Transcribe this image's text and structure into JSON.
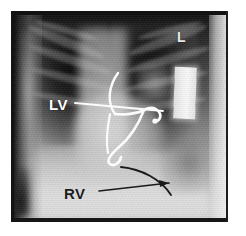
{
  "figure": {
    "kind": "chest-radiograph",
    "modality": "X-ray",
    "view": "frontal chest",
    "background_color": "#ffffff",
    "film_border_color": "#141414"
  },
  "annotations": {
    "lv": {
      "label": "LV",
      "color": "#ffffff",
      "pointer": "white line from label to left ventricular lead tip",
      "description": "left ventricular pacing lead"
    },
    "rv": {
      "label": "RV",
      "color": "#1c1c1c",
      "pointer": "black arrow from label to curved black contour",
      "description": "right ventricular lead / border"
    },
    "side_marker": {
      "label": "L",
      "color": "#e8e8e8",
      "description": "left side radiographic marker"
    }
  },
  "overlay_graphics": {
    "lv_pointer_line": "M 64 92 L 152 100",
    "lead_upper_curve": "M 107 62 C 97 76, 96 92, 104 103",
    "lead_main": "M 104 103 C 112 104, 126 103, 133 99 C 140 95, 145 97, 148 101 C 151 105, 149 110, 143 111",
    "lead_descending": "M 133 99 C 128 112, 120 126, 108 136 C 99 144, 95 150, 99 153 C 103 156, 109 152, 110 146",
    "lead_left_tail": "M 99 103 C 96 118, 95 132, 97 142",
    "lead_tip_dot": {
      "cx": 144,
      "cy": 110,
      "r": 2.6
    },
    "rv_curve": "M 110 156 C 130 158, 150 168, 160 184",
    "rv_arrow_line": "M 88 180 L 158 172",
    "rv_arrow_head": "158,172 148,169 149,176",
    "device_box": {
      "x": 163,
      "y": 56,
      "w": 22,
      "h": 52
    }
  },
  "colors": {
    "lead_white": "#fbfbfb",
    "annotation_black": "#1a1a1a",
    "page_white": "#ffffff",
    "film_dark": "#141414"
  }
}
